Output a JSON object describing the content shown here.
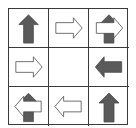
{
  "puzzle": {
    "title": "",
    "colors": {
      "grid_line": "#3a3a3a",
      "dark_arrow_fill": "#5a5a5a",
      "light_arrow_fill": "#ffffff",
      "arrow_stroke": "#4a4a4a"
    },
    "rows": 3,
    "cols": 3,
    "cells": [
      {
        "row": 0,
        "col": 0,
        "layers": [
          {
            "shape": "arrow",
            "direction": "up",
            "style": "dark"
          }
        ]
      },
      {
        "row": 0,
        "col": 1,
        "layers": [
          {
            "shape": "arrow",
            "direction": "right",
            "style": "light"
          }
        ]
      },
      {
        "row": 0,
        "col": 2,
        "layers": [
          {
            "shape": "arrow",
            "direction": "up",
            "style": "dark"
          },
          {
            "shape": "arrow",
            "direction": "right",
            "style": "light"
          }
        ]
      },
      {
        "row": 1,
        "col": 0,
        "layers": [
          {
            "shape": "arrow",
            "direction": "right",
            "style": "light"
          }
        ]
      },
      {
        "row": 1,
        "col": 1,
        "layers": [],
        "empty": true
      },
      {
        "row": 1,
        "col": 2,
        "layers": [
          {
            "shape": "arrow",
            "direction": "left",
            "style": "dark"
          }
        ]
      },
      {
        "row": 2,
        "col": 0,
        "layers": [
          {
            "shape": "arrow",
            "direction": "up",
            "style": "dark"
          },
          {
            "shape": "arrow",
            "direction": "left",
            "style": "light"
          }
        ]
      },
      {
        "row": 2,
        "col": 1,
        "layers": [
          {
            "shape": "arrow",
            "direction": "left",
            "style": "light"
          }
        ]
      },
      {
        "row": 2,
        "col": 2,
        "layers": [
          {
            "shape": "arrow",
            "direction": "up",
            "style": "dark"
          }
        ]
      }
    ]
  }
}
